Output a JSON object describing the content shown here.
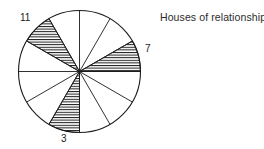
{
  "title": "Houses of relationships",
  "chart_data": {
    "type": "pie",
    "title": "Houses of relationships",
    "xlabel": "",
    "ylabel": "",
    "grid": false,
    "legend": "none",
    "center_x": 79.5,
    "center_y": 71.5,
    "radius": 61,
    "sector_count": 12,
    "sector_degrees": 30,
    "categories": [
      "1",
      "2",
      "3",
      "4",
      "5",
      "6",
      "7",
      "8",
      "9",
      "10",
      "11",
      "12"
    ],
    "values": [
      30,
      30,
      30,
      30,
      30,
      30,
      30,
      30,
      30,
      30,
      30,
      30
    ],
    "highlighted": [
      3,
      7,
      11
    ],
    "sectors": [
      {
        "house": "1",
        "start_deg": 0,
        "end_deg": 30,
        "hatched": true,
        "label": "7",
        "label_visible": true
      },
      {
        "house": "2",
        "start_deg": 30,
        "end_deg": 60,
        "hatched": false,
        "label": "",
        "label_visible": false
      },
      {
        "house": "3",
        "start_deg": 60,
        "end_deg": 90,
        "hatched": false,
        "label": "",
        "label_visible": false
      },
      {
        "house": "4",
        "start_deg": 90,
        "end_deg": 120,
        "hatched": false,
        "label": "",
        "label_visible": false
      },
      {
        "house": "5",
        "start_deg": 120,
        "end_deg": 150,
        "hatched": true,
        "label": "11",
        "label_visible": true
      },
      {
        "house": "6",
        "start_deg": 150,
        "end_deg": 180,
        "hatched": false,
        "label": "",
        "label_visible": false
      },
      {
        "house": "7",
        "start_deg": 180,
        "end_deg": 210,
        "hatched": false,
        "label": "",
        "label_visible": false
      },
      {
        "house": "8",
        "start_deg": 210,
        "end_deg": 240,
        "hatched": false,
        "label": "",
        "label_visible": false
      },
      {
        "house": "9",
        "start_deg": 240,
        "end_deg": 270,
        "hatched": true,
        "label": "3",
        "label_visible": true
      },
      {
        "house": "10",
        "start_deg": 270,
        "end_deg": 300,
        "hatched": false,
        "label": "",
        "label_visible": false
      },
      {
        "house": "11",
        "start_deg": 300,
        "end_deg": 330,
        "hatched": false,
        "label": "",
        "label_visible": false
      },
      {
        "house": "12",
        "start_deg": 330,
        "end_deg": 360,
        "hatched": false,
        "label": "",
        "label_visible": false
      }
    ],
    "labels": [
      {
        "text": "11",
        "x": 20,
        "y": 12
      },
      {
        "text": "7",
        "x": 145,
        "y": 43
      },
      {
        "text": "3",
        "x": 61,
        "y": 133
      }
    ]
  },
  "colors": {
    "stroke": "#1a1a1a",
    "background": "#ffffff",
    "hatch": "#1a1a1a",
    "title_text": "#2b2b2b",
    "label_text": "#1a1a1a"
  }
}
